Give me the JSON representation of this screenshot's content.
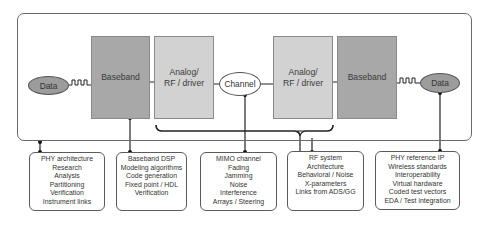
{
  "diagram": {
    "signal_chain": {
      "tx_data": "Data",
      "tx_baseband": "Baseband",
      "tx_analog": [
        "Analog/",
        "RF / driver"
      ],
      "channel": "Channel",
      "rx_analog": [
        "Analog/",
        "RF / driver"
      ],
      "rx_baseband": "Baseband",
      "rx_data": "Data"
    },
    "info_boxes": [
      {
        "id": "phy-architecture",
        "lines": [
          "PHY architecture",
          "Research",
          "Analysis",
          "Partitioning",
          "Verification",
          "Instrument links"
        ]
      },
      {
        "id": "baseband-dsp",
        "lines": [
          "Baseband DSP",
          "Modeling algorithms",
          "Code generation",
          "Fixed point / HDL",
          "Verification"
        ]
      },
      {
        "id": "mimo-channel",
        "lines": [
          "MIMO channel",
          "Fading",
          "Jamming",
          "Noise",
          "Interference",
          "Arrays / Steering"
        ]
      },
      {
        "id": "rf-system",
        "lines": [
          "RF system",
          "Architecture",
          "Behavioral / Noise",
          "X-parameters",
          "Links from ADS/GG"
        ]
      },
      {
        "id": "phy-reference-ip",
        "lines": [
          "PHY reference IP",
          "Wireless standards",
          "Interoperability",
          "Virtual hardware",
          "Coded test vectors",
          "EDA / Test integration"
        ]
      }
    ],
    "colors": {
      "baseband_fill": "#a8a8a8",
      "analog_fill": "#d2d2d2",
      "data_fill": "#9c9c9c",
      "channel_fill": "#ffffff",
      "line": "#1a1a1a",
      "frame": "#6a6a6a"
    }
  }
}
